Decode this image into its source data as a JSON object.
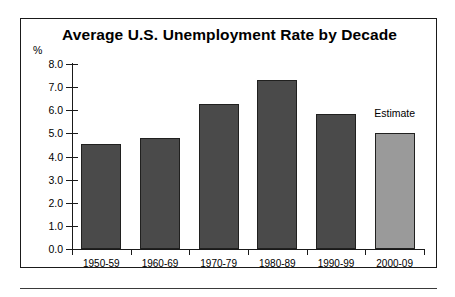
{
  "figure": {
    "frame_border_color": "#1a1a1a",
    "background": "#ffffff"
  },
  "chart_data": {
    "type": "bar",
    "title": "Average U.S. Unemployment Rate by Decade",
    "xlabel": "",
    "ylabel": "",
    "y_unit_label": "%",
    "categories": [
      "1950-59",
      "1960-69",
      "1970-79",
      "1980-89",
      "1990-99",
      "2000-09"
    ],
    "values": [
      4.55,
      4.8,
      6.25,
      7.3,
      5.85,
      5.0
    ],
    "ylim": [
      0.0,
      8.0
    ],
    "ytick_step": 1.0,
    "ytick_labels": [
      "8.0",
      "7.0",
      "6.0",
      "5.0",
      "4.0",
      "3.0",
      "2.0",
      "1.0",
      "0.0"
    ],
    "grid": false,
    "legend": false,
    "annotations": [
      {
        "text": "Estimate",
        "category": "2000-09"
      }
    ],
    "series_colors": {
      "actual": "#4a4a4a",
      "estimate": "#9a9a9a"
    },
    "bar_kinds": [
      "actual",
      "actual",
      "actual",
      "actual",
      "actual",
      "estimate"
    ]
  }
}
